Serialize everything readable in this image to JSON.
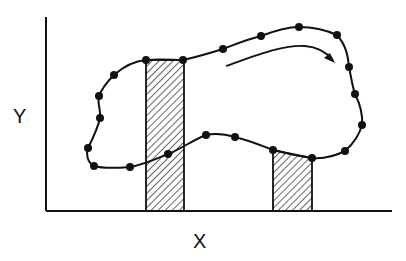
{
  "diagram": {
    "x_axis_label": "X",
    "y_axis_label": "Y",
    "colors": {
      "ink": "#111111",
      "background": "#ffffff"
    },
    "axes": {
      "origin": [
        46,
        211
      ],
      "x_end": [
        392,
        211
      ],
      "y_end": [
        46,
        17
      ]
    },
    "loop_points": [
      [
        146,
        60
      ],
      [
        183,
        60
      ],
      [
        223,
        49
      ],
      [
        261,
        36
      ],
      [
        299,
        27
      ],
      [
        337,
        35
      ],
      [
        349,
        67
      ],
      [
        355,
        94
      ],
      [
        362,
        125
      ],
      [
        345,
        151
      ],
      [
        312,
        158
      ],
      [
        273,
        150
      ],
      [
        235,
        137
      ],
      [
        206,
        135
      ],
      [
        168,
        154
      ],
      [
        130,
        167
      ],
      [
        94,
        166
      ],
      [
        88,
        148
      ],
      [
        100,
        118
      ],
      [
        99,
        96
      ],
      [
        114,
        75
      ]
    ],
    "hatched_strips": [
      {
        "name": "left-strip",
        "x0": 146,
        "x1": 184,
        "top": 60,
        "bottom": 211
      },
      {
        "name": "right-strip",
        "x0": 273,
        "x1": 312,
        "top_left": 150,
        "top_right": 158,
        "bottom": 211
      }
    ],
    "direction_arrow": {
      "direction": "clockwise",
      "from": [
        226,
        66
      ],
      "to": [
        333,
        61
      ]
    }
  }
}
